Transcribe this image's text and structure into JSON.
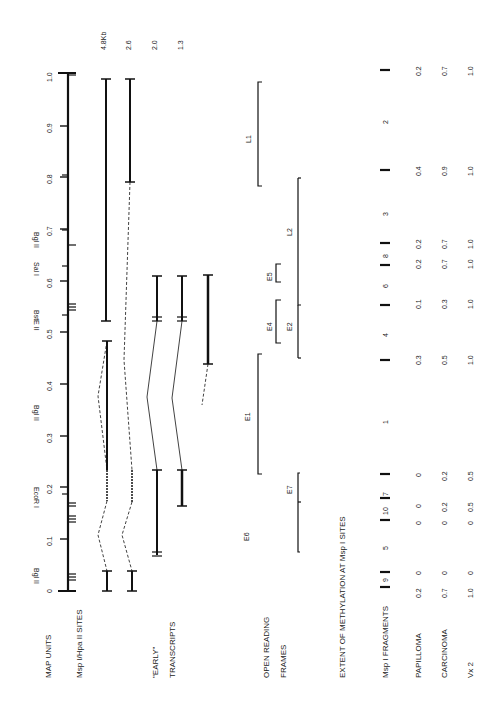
{
  "figure": {
    "row_labels": {
      "map_units": "MAP UNITS",
      "msp_sites": "Msp I/Hpa II SITES",
      "early": "\"EARLY\"",
      "transcripts": "TRANSCRIPTS",
      "orf1": "OPEN READING",
      "orf2": "FRAMES",
      "methylation_title": "EXTENT OF METHYLATION AT Msp I SITES",
      "fragments": "Msp I FRAGMENTS",
      "papilloma": "PAPILLOMA",
      "carcinoma": "CARCINOMA",
      "vx2": "Vx 2"
    },
    "map_ticks": [
      "0",
      "0.1",
      "0.2",
      "0.3",
      "0.4",
      "0.5",
      "0.6",
      "0.7",
      "0.8",
      "0.9",
      "1.0"
    ],
    "restriction_sites": [
      "Bgl II",
      "EcoR I",
      "Bgl II",
      "BstE II",
      "Sal I",
      "Bgl II"
    ],
    "transcript_sizes": [
      "4.8Kb",
      "2.6",
      "2.0",
      "1.3"
    ],
    "orfs": [
      "E6",
      "E7",
      "E1",
      "E4",
      "E2",
      "E5",
      "L2",
      "L1"
    ],
    "fragments": [
      "9",
      "5",
      "10",
      "7",
      "1",
      "4",
      "6",
      "8",
      "3",
      "2"
    ],
    "methylation": {
      "papilloma": [
        "0.2",
        "0",
        "0",
        "0",
        "0",
        "0.3",
        "0.1",
        "0.2",
        "0.2",
        "0.4",
        "0.2"
      ],
      "carcinoma": [
        "0.7",
        "0",
        "0",
        "0.2",
        "0.2",
        "0.5",
        "0.3",
        "0.7",
        "0.7",
        "0.9",
        "0.7"
      ],
      "vx2": [
        "1.0",
        "0",
        "0",
        "0.5",
        "0.5",
        "1.0",
        "1.0",
        "1.0",
        "1.0",
        "1.0",
        "1.0"
      ]
    }
  }
}
